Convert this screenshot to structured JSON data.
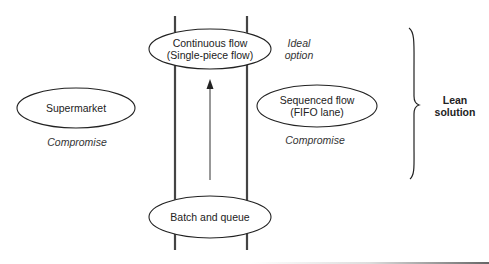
{
  "diagram": {
    "nodes": {
      "continuous_flow": {
        "line1": "Continuous flow",
        "line2": "(Single-piece flow)"
      },
      "supermarket": {
        "label": "Supermarket"
      },
      "sequenced_flow": {
        "line1": "Sequenced flow",
        "line2": "(FIFO lane)"
      },
      "batch_and_queue": {
        "label": "Batch and queue"
      }
    },
    "annotations": {
      "ideal_line1": "Ideal",
      "ideal_line2": "option",
      "supermarket_note": "Compromise",
      "sequenced_note": "Compromise"
    },
    "brace_label": {
      "line1": "Lean",
      "line2": "solution"
    },
    "colors": {
      "stroke": "#222222",
      "pipe": "#444444",
      "background": "#ffffff"
    }
  }
}
